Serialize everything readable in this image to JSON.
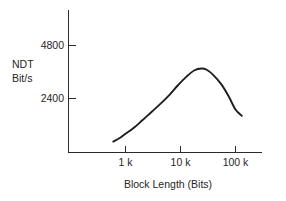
{
  "chart_data": {
    "type": "line",
    "title": "",
    "xlabel": "Block Length (Bits)",
    "ylabel": "NDT Bit/s",
    "ylabel_line1": "NDT",
    "ylabel_line2": "Bit/s",
    "x_scale": "log",
    "x_tick_labels": [
      "1 k",
      "10 k",
      "100 k"
    ],
    "x_tick_values": [
      1000,
      10000,
      100000
    ],
    "xlim": [
      400,
      400000
    ],
    "y_tick_labels": [
      "2400",
      "4800"
    ],
    "y_tick_values": [
      2400,
      4800
    ],
    "ylim": [
      0,
      6000
    ],
    "grid": false,
    "legend": null,
    "series": [
      {
        "name": "NDT",
        "x": [
          600,
          800,
          1000,
          1400,
          2000,
          3000,
          4500,
          6500,
          9000,
          13000,
          18000,
          24000,
          30000,
          40000,
          55000,
          75000,
          100000,
          130000
        ],
        "y": [
          450,
          620,
          800,
          1060,
          1400,
          1800,
          2200,
          2600,
          3000,
          3400,
          3680,
          3760,
          3700,
          3450,
          3050,
          2500,
          1900,
          1620
        ]
      }
    ]
  },
  "style": {
    "background": "#ffffff",
    "axis_color": "#2b2b2b",
    "curve_color": "#1d1d1d",
    "text_color": "#262626"
  }
}
